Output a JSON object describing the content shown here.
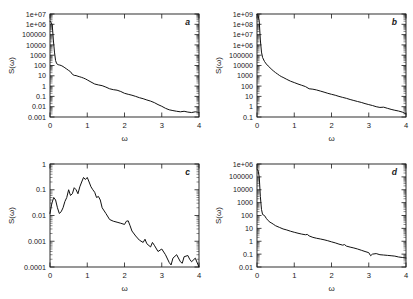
{
  "figure": {
    "background": "#ffffff",
    "curve_color": "#111111",
    "axis_color": "#1a1a1a",
    "layout": "2x2 grid of log-linear power spectrum panels"
  },
  "chart_data": [
    {
      "type": "line",
      "panel_label": "a",
      "title": "",
      "xlabel": "ω",
      "ylabel": "S(ω)",
      "xlim": [
        0,
        4
      ],
      "ylim": [
        0.001,
        10000000
      ],
      "yscale": "log",
      "xscale": "linear",
      "grid": false,
      "legend": null,
      "xticks": [
        0,
        1,
        2,
        3,
        4
      ],
      "xticklabels": [
        "0",
        "1",
        "2",
        "3",
        "4"
      ],
      "yticks": [
        0.001,
        0.01,
        0.1,
        1,
        10,
        100,
        1000,
        10000,
        100000,
        1000000,
        10000000
      ],
      "yticklabels": [
        "0.001",
        "0.01",
        "0.1",
        "1",
        "10",
        "100",
        "1000",
        "10000",
        "100000",
        "1e+06",
        "1e+07"
      ],
      "x": [
        0.0,
        0.03,
        0.06,
        0.09,
        0.12,
        0.15,
        0.18,
        0.22,
        0.26,
        0.3,
        0.35,
        0.4,
        0.45,
        0.5,
        0.55,
        0.6,
        0.65,
        0.7,
        0.75,
        0.8,
        0.85,
        0.9,
        0.95,
        1.0,
        1.1,
        1.2,
        1.3,
        1.4,
        1.5,
        1.6,
        1.7,
        1.8,
        1.9,
        2.0,
        2.1,
        2.2,
        2.3,
        2.4,
        2.5,
        2.6,
        2.7,
        2.8,
        2.9,
        3.0,
        3.1,
        3.2,
        3.3,
        3.4,
        3.5,
        3.6,
        3.7,
        3.8,
        3.9,
        4.0
      ],
      "y": [
        2000000.0,
        1500000.0,
        900000.0,
        30000.0,
        2000.0,
        300.0,
        150.0,
        120.0,
        110.0,
        100.0,
        80.0,
        60.0,
        45.0,
        33.0,
        25.0,
        14.0,
        11.0,
        10.5,
        9.0,
        8.0,
        7.0,
        6.0,
        5.0,
        4.0,
        2.5,
        1.6,
        1.3,
        1.1,
        0.8,
        0.55,
        0.45,
        0.4,
        0.3,
        0.2,
        0.16,
        0.13,
        0.1,
        0.075,
        0.06,
        0.045,
        0.035,
        0.025,
        0.016,
        0.011,
        0.007,
        0.005,
        0.0042,
        0.0036,
        0.0032,
        0.0036,
        0.003,
        0.0027,
        0.0032,
        0.0028
      ]
    },
    {
      "type": "line",
      "panel_label": "b",
      "title": "",
      "xlabel": "ω",
      "ylabel": "S(ω)",
      "xlim": [
        0,
        4
      ],
      "ylim": [
        0.1,
        1000000000
      ],
      "yscale": "log",
      "xscale": "linear",
      "grid": false,
      "legend": null,
      "xticks": [
        0,
        1,
        2,
        3,
        4
      ],
      "xticklabels": [
        "0",
        "1",
        "2",
        "3",
        "4"
      ],
      "yticks": [
        0.1,
        1,
        10,
        100,
        1000,
        10000,
        100000,
        1000000,
        10000000,
        100000000,
        1000000000
      ],
      "yticklabels": [
        "0.1",
        "1",
        "10",
        "100",
        "1000",
        "10000",
        "100000",
        "1e+06",
        "1e+07",
        "1e+08",
        "1e+09"
      ],
      "x": [
        0.0,
        0.03,
        0.06,
        0.09,
        0.12,
        0.15,
        0.2,
        0.25,
        0.3,
        0.35,
        0.4,
        0.45,
        0.5,
        0.55,
        0.6,
        0.65,
        0.7,
        0.8,
        0.9,
        1.0,
        1.1,
        1.2,
        1.3,
        1.4,
        1.5,
        1.6,
        1.7,
        1.8,
        1.9,
        2.0,
        2.1,
        2.2,
        2.3,
        2.4,
        2.5,
        2.6,
        2.7,
        2.8,
        2.9,
        3.0,
        3.1,
        3.2,
        3.3,
        3.4,
        3.5,
        3.6,
        3.7,
        3.8,
        3.9,
        4.0
      ],
      "y": [
        900000000.0,
        700000000.0,
        200000000.0,
        3000000.0,
        200000.0,
        60000.0,
        25000.0,
        14000.0,
        9000.0,
        6000.0,
        4000.0,
        2800.0,
        2000.0,
        1500.0,
        1100.0,
        850.0,
        700.0,
        450.0,
        300.0,
        220.0,
        160.0,
        120.0,
        90.0,
        55.0,
        50.0,
        42.0,
        33.0,
        26.0,
        20.0,
        16.0,
        13.0,
        10.0,
        8.0,
        6.5,
        5.0,
        4.0,
        3.2,
        2.6,
        2.0,
        1.6,
        1.3,
        1.0,
        0.85,
        0.9,
        0.7,
        0.55,
        0.45,
        0.38,
        0.3,
        0.2
      ]
    },
    {
      "type": "line",
      "panel_label": "c",
      "title": "",
      "xlabel": "ω",
      "ylabel": "S(ω)",
      "xlim": [
        0,
        4
      ],
      "ylim": [
        0.0001,
        1
      ],
      "yscale": "log",
      "xscale": "linear",
      "grid": false,
      "legend": null,
      "xticks": [
        0,
        1,
        2,
        3,
        4
      ],
      "xticklabels": [
        "0",
        "1",
        "2",
        "3",
        "4"
      ],
      "yticks": [
        0.0001,
        0.001,
        0.01,
        0.1,
        1
      ],
      "yticklabels": [
        "0.0001",
        "0.001",
        "0.01",
        "0.1",
        "1"
      ],
      "x": [
        0.0,
        0.05,
        0.1,
        0.15,
        0.2,
        0.25,
        0.3,
        0.35,
        0.4,
        0.45,
        0.5,
        0.55,
        0.6,
        0.65,
        0.7,
        0.75,
        0.8,
        0.85,
        0.9,
        0.95,
        1.0,
        1.05,
        1.1,
        1.15,
        1.2,
        1.25,
        1.3,
        1.35,
        1.4,
        1.5,
        1.6,
        1.7,
        1.8,
        1.9,
        2.0,
        2.05,
        2.1,
        2.15,
        2.2,
        2.3,
        2.4,
        2.5,
        2.55,
        2.6,
        2.7,
        2.75,
        2.8,
        2.9,
        3.0,
        3.1,
        3.2,
        3.25,
        3.3,
        3.4,
        3.5,
        3.55,
        3.6,
        3.7,
        3.75,
        3.8,
        3.9,
        4.0
      ],
      "y": [
        0.012,
        0.03,
        0.05,
        0.04,
        0.02,
        0.012,
        0.014,
        0.02,
        0.035,
        0.05,
        0.1,
        0.06,
        0.07,
        0.12,
        0.1,
        0.07,
        0.13,
        0.2,
        0.3,
        0.25,
        0.3,
        0.2,
        0.13,
        0.1,
        0.08,
        0.05,
        0.055,
        0.04,
        0.02,
        0.012,
        0.007,
        0.006,
        0.0055,
        0.005,
        0.0045,
        0.006,
        0.0062,
        0.004,
        0.0025,
        0.0016,
        0.0011,
        0.0009,
        0.0012,
        0.0008,
        0.0006,
        0.0009,
        0.0007,
        0.0004,
        0.0005,
        0.0003,
        0.00015,
        0.00012,
        0.00022,
        0.0003,
        0.00016,
        0.00014,
        0.00025,
        0.00028,
        0.0002,
        0.00016,
        0.00022,
        0.0001
      ]
    },
    {
      "type": "line",
      "panel_label": "d",
      "title": "",
      "xlabel": "ω",
      "ylabel": "S(ω)",
      "xlim": [
        0,
        4
      ],
      "ylim": [
        0.01,
        1000000
      ],
      "yscale": "log",
      "xscale": "linear",
      "grid": false,
      "legend": null,
      "xticks": [
        0,
        1,
        2,
        3,
        4
      ],
      "xticklabels": [
        "0",
        "1",
        "2",
        "3",
        "4"
      ],
      "yticks": [
        0.01,
        0.1,
        1,
        10,
        100,
        1000,
        10000,
        100000,
        1000000
      ],
      "yticklabels": [
        "0.01",
        "0.1",
        "1",
        "10",
        "100",
        "1000",
        "10000",
        "100000",
        "1e+06"
      ],
      "x": [
        0.0,
        0.03,
        0.06,
        0.09,
        0.12,
        0.15,
        0.2,
        0.25,
        0.3,
        0.35,
        0.4,
        0.45,
        0.5,
        0.6,
        0.7,
        0.8,
        0.9,
        1.0,
        1.1,
        1.2,
        1.3,
        1.35,
        1.4,
        1.5,
        1.6,
        1.7,
        1.8,
        1.9,
        2.0,
        2.1,
        2.2,
        2.3,
        2.35,
        2.4,
        2.5,
        2.6,
        2.7,
        2.8,
        2.9,
        3.0,
        3.05,
        3.1,
        3.2,
        3.3,
        3.4,
        3.5,
        3.6,
        3.7,
        3.8,
        3.9,
        4.0
      ],
      "y": [
        400000.0,
        300000.0,
        100000.0,
        3000.0,
        300.0,
        120.0,
        100.0,
        60.0,
        40.0,
        30.0,
        25.0,
        20.0,
        16.0,
        12.0,
        9.0,
        7.5,
        6.0,
        5.0,
        4.2,
        3.6,
        3.2,
        3.4,
        2.6,
        2.0,
        1.7,
        1.5,
        1.3,
        1.1,
        0.9,
        0.75,
        0.6,
        0.5,
        0.55,
        0.42,
        0.35,
        0.3,
        0.25,
        0.2,
        0.16,
        0.13,
        0.075,
        0.1,
        0.11,
        0.09,
        0.085,
        0.08,
        0.075,
        0.07,
        0.06,
        0.055,
        0.05
      ]
    }
  ]
}
